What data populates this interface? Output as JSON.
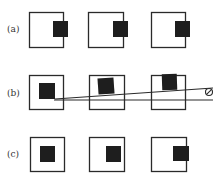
{
  "figure": {
    "rows": [
      {
        "label": "(a)",
        "label_y": 32,
        "boxes": [
          {
            "x": 29,
            "y": 12,
            "w": 34,
            "h": 35,
            "fill": {
              "x": 53,
              "y": 21,
              "w": 15,
              "h": 16,
              "rot": 0
            }
          },
          {
            "x": 88,
            "y": 12,
            "w": 35,
            "h": 35,
            "fill": {
              "x": 113,
              "y": 21,
              "w": 15,
              "h": 16,
              "rot": 0
            }
          },
          {
            "x": 151,
            "y": 12,
            "w": 34,
            "h": 35,
            "fill": {
              "x": 175,
              "y": 21,
              "w": 15,
              "h": 16,
              "rot": 0
            }
          }
        ]
      },
      {
        "label": "(b)",
        "label_y": 96,
        "boxes": [
          {
            "x": 29,
            "y": 75,
            "w": 34,
            "h": 34,
            "fill": {
              "x": 39,
              "y": 83,
              "w": 16,
              "h": 16,
              "rot": 0
            }
          },
          {
            "x": 89,
            "y": 75,
            "w": 35,
            "h": 34,
            "fill": {
              "x": 98,
              "y": 78,
              "w": 16,
              "h": 16,
              "rot": -4
            }
          },
          {
            "x": 151,
            "y": 75,
            "w": 34,
            "h": 34,
            "fill": {
              "x": 162,
              "y": 74,
              "w": 15,
              "h": 16,
              "rot": -2
            }
          }
        ]
      },
      {
        "label": "(c)",
        "label_y": 157,
        "boxes": [
          {
            "x": 30,
            "y": 137,
            "w": 34,
            "h": 34,
            "fill": {
              "x": 40,
              "y": 146,
              "w": 15,
              "h": 16,
              "rot": 0
            }
          },
          {
            "x": 89,
            "y": 137,
            "w": 35,
            "h": 34,
            "fill": {
              "x": 106,
              "y": 146,
              "w": 15,
              "h": 16,
              "rot": 0
            }
          },
          {
            "x": 151,
            "y": 137,
            "w": 35,
            "h": 34,
            "fill": {
              "x": 173,
              "y": 146,
              "w": 16,
              "h": 15,
              "rot": 0
            }
          }
        ]
      }
    ],
    "lines": [
      {
        "name": "horizontal-reference-line",
        "x1": 54,
        "y1": 100,
        "x2": 213,
        "y2": 100
      },
      {
        "name": "sloped-line",
        "x1": 55,
        "y1": 99,
        "x2": 213,
        "y2": 88
      }
    ],
    "pivot": {
      "cx": 209,
      "cy": 92,
      "r": 3.5,
      "symbol": "circle-with-slash"
    },
    "colors": {
      "stroke": "#2a2a2a",
      "fill": "#1e1e1e",
      "label": "#333333"
    }
  }
}
